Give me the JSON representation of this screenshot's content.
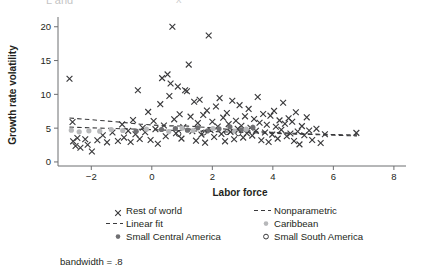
{
  "figure": {
    "note": "bandwidth = .8",
    "top_artifact_left": "L and",
    "top_artifact_right": "x"
  },
  "chart_data": {
    "type": "scatter",
    "title": "",
    "xlabel": "Labor force",
    "ylabel": "Growth rate volatility",
    "xlim": [
      -3.1,
      8.4
    ],
    "ylim": [
      -0.6,
      21.0
    ],
    "xticks": [
      -2,
      0,
      2,
      4,
      6,
      8
    ],
    "xtick_labels": [
      "−2",
      "0",
      "2",
      "4",
      "6",
      "8"
    ],
    "yticks": [
      0,
      5,
      10,
      15,
      20
    ],
    "ytick_labels": [
      "0",
      "5",
      "10",
      "15",
      "20"
    ],
    "grid": false,
    "legend_position": "below-axes",
    "series": [
      {
        "name": "Rest of world",
        "marker": "x",
        "color": "#3a3a3c",
        "points": [
          [
            -2.72,
            12.3
          ],
          [
            -2.62,
            5.9
          ],
          [
            -2.6,
            3.05
          ],
          [
            -2.52,
            2.35
          ],
          [
            -2.46,
            3.55
          ],
          [
            -2.36,
            2.1
          ],
          [
            -2.2,
            3.35
          ],
          [
            -2.12,
            2.55
          ],
          [
            -1.98,
            1.55
          ],
          [
            -1.8,
            3.2
          ],
          [
            -1.62,
            3.95
          ],
          [
            -1.48,
            2.9
          ],
          [
            -1.3,
            4.35
          ],
          [
            -1.12,
            3.1
          ],
          [
            -0.98,
            5.55
          ],
          [
            -0.92,
            3.6
          ],
          [
            -0.78,
            4.6
          ],
          [
            -0.7,
            2.95
          ],
          [
            -0.62,
            6.2
          ],
          [
            -0.54,
            4.1
          ],
          [
            -0.46,
            10.6
          ],
          [
            -0.4,
            3.4
          ],
          [
            -0.3,
            5.05
          ],
          [
            -0.22,
            4.4
          ],
          [
            -0.12,
            7.4
          ],
          [
            -0.04,
            3.25
          ],
          [
            0.06,
            6.05
          ],
          [
            0.12,
            4.85
          ],
          [
            0.2,
            2.7
          ],
          [
            0.28,
            8.55
          ],
          [
            0.34,
            12.4
          ],
          [
            0.4,
            5.4
          ],
          [
            0.46,
            3.8
          ],
          [
            0.52,
            12.95
          ],
          [
            0.58,
            9.75
          ],
          [
            0.62,
            11.6
          ],
          [
            0.68,
            20.0
          ],
          [
            0.74,
            6.3
          ],
          [
            0.8,
            4.25
          ],
          [
            0.86,
            11.15
          ],
          [
            0.92,
            7.05
          ],
          [
            0.98,
            3.45
          ],
          [
            1.04,
            5.15
          ],
          [
            1.1,
            10.6
          ],
          [
            1.16,
            10.45
          ],
          [
            1.22,
            14.4
          ],
          [
            1.28,
            6.7
          ],
          [
            1.34,
            4.55
          ],
          [
            1.4,
            8.9
          ],
          [
            1.46,
            3.15
          ],
          [
            1.52,
            5.75
          ],
          [
            1.58,
            9.2
          ],
          [
            1.64,
            4.05
          ],
          [
            1.7,
            6.95
          ],
          [
            1.76,
            2.85
          ],
          [
            1.82,
            7.6
          ],
          [
            1.88,
            18.7
          ],
          [
            1.94,
            4.7
          ],
          [
            2.0,
            5.95
          ],
          [
            2.06,
            3.7
          ],
          [
            2.12,
            8.2
          ],
          [
            2.18,
            5.25
          ],
          [
            2.24,
            9.45
          ],
          [
            2.3,
            4.15
          ],
          [
            2.36,
            6.55
          ],
          [
            2.42,
            3.05
          ],
          [
            2.48,
            7.25
          ],
          [
            2.54,
            5.6
          ],
          [
            2.6,
            4.45
          ],
          [
            2.66,
            9.05
          ],
          [
            2.72,
            3.35
          ],
          [
            2.78,
            6.1
          ],
          [
            2.84,
            4.9
          ],
          [
            2.9,
            8.4
          ],
          [
            2.96,
            5.35
          ],
          [
            3.02,
            3.6
          ],
          [
            3.08,
            6.75
          ],
          [
            3.14,
            4.25
          ],
          [
            3.2,
            7.85
          ],
          [
            3.26,
            5.05
          ],
          [
            3.32,
            3.9
          ],
          [
            3.38,
            6.35
          ],
          [
            3.44,
            4.6
          ],
          [
            3.5,
            9.6
          ],
          [
            3.56,
            5.8
          ],
          [
            3.62,
            3.2
          ],
          [
            3.68,
            7.1
          ],
          [
            3.74,
            4.35
          ],
          [
            3.8,
            5.5
          ],
          [
            3.86,
            2.95
          ],
          [
            3.92,
            6.85
          ],
          [
            3.98,
            4.05
          ],
          [
            4.04,
            7.55
          ],
          [
            4.1,
            5.2
          ],
          [
            4.16,
            3.45
          ],
          [
            4.22,
            6.15
          ],
          [
            4.28,
            4.75
          ],
          [
            4.34,
            8.75
          ],
          [
            4.4,
            5.65
          ],
          [
            4.46,
            3.8
          ],
          [
            4.52,
            6.45
          ],
          [
            4.58,
            4.2
          ],
          [
            4.64,
            5.95
          ],
          [
            4.7,
            3.1
          ],
          [
            4.76,
            7.35
          ],
          [
            4.82,
            4.5
          ],
          [
            4.88,
            2.6
          ],
          [
            4.96,
            5.3
          ],
          [
            5.04,
            3.95
          ],
          [
            5.12,
            6.6
          ],
          [
            5.2,
            4.65
          ],
          [
            5.3,
            3.25
          ],
          [
            5.44,
            4.9
          ],
          [
            5.58,
            2.8
          ],
          [
            5.72,
            4.1
          ],
          [
            6.76,
            4.3
          ]
        ]
      },
      {
        "name": "Small Central America",
        "marker": "o-filled-dark",
        "color": "#6f6f72",
        "points": [
          [
            -0.52,
            4.55
          ],
          [
            0.32,
            4.8
          ],
          [
            0.78,
            4.95
          ],
          [
            1.18,
            4.7
          ],
          [
            1.52,
            5.05
          ],
          [
            1.84,
            4.6
          ],
          [
            2.22,
            4.9
          ],
          [
            2.58,
            5.2
          ],
          [
            2.96,
            4.75
          ],
          [
            3.34,
            5.1
          ]
        ]
      },
      {
        "name": "Caribbean",
        "marker": "o-filled-gray",
        "color": "#b7b8ba",
        "points": [
          [
            -2.66,
            4.7
          ],
          [
            -2.4,
            4.45
          ],
          [
            -2.08,
            4.6
          ],
          [
            -1.72,
            4.55
          ],
          [
            -1.34,
            4.8
          ],
          [
            -0.96,
            4.65
          ],
          [
            -0.18,
            4.85
          ],
          [
            0.56,
            4.5
          ],
          [
            1.0,
            5.0
          ],
          [
            1.36,
            4.65
          ],
          [
            2.02,
            4.95
          ],
          [
            2.74,
            4.55
          ],
          [
            3.12,
            4.85
          ]
        ]
      },
      {
        "name": "Small South America",
        "marker": "o-open",
        "color": "#3a3a3c",
        "points": [
          [
            1.72,
            4.35
          ],
          [
            2.48,
            4.4
          ],
          [
            2.86,
            4.25
          ],
          [
            0.88,
            4.15
          ]
        ]
      }
    ],
    "fits": [
      {
        "name": "Linear fit",
        "style": "dashed",
        "color": "#3a3a3c",
        "points": [
          [
            -2.72,
            5.15
          ],
          [
            6.78,
            3.85
          ]
        ]
      },
      {
        "name": "Nonparametric",
        "style": "dashed",
        "color": "#3a3a3c",
        "points": [
          [
            -2.72,
            6.5
          ],
          [
            -2.0,
            6.25
          ],
          [
            -1.2,
            5.95
          ],
          [
            -0.4,
            5.6
          ],
          [
            0.4,
            5.35
          ],
          [
            1.2,
            5.3
          ],
          [
            2.0,
            5.05
          ],
          [
            2.8,
            4.7
          ],
          [
            3.6,
            4.45
          ],
          [
            4.4,
            4.3
          ],
          [
            5.2,
            4.15
          ],
          [
            6.0,
            4.05
          ],
          [
            6.78,
            4.0
          ]
        ]
      }
    ],
    "legend": [
      {
        "label": "Rest of world",
        "marker": "x"
      },
      {
        "label": "Nonparametric",
        "marker": "dashed-line"
      },
      {
        "label": "Linear fit",
        "marker": "dashed-line"
      },
      {
        "label": "Caribbean",
        "marker": "o-filled-gray"
      },
      {
        "label": "Small Central America",
        "marker": "o-filled-dark"
      },
      {
        "label": "Small South America",
        "marker": "o-open"
      }
    ]
  }
}
